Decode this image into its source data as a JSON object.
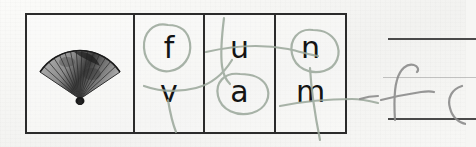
{
  "worksheet": {
    "title": "Middle sound letter choice worksheet",
    "background_color": "#f6f6f4",
    "border_color": "#2b2b2b",
    "marker_color": "#9aa79a",
    "pencil_color": "#8c8c8c",
    "letter_color": "#141414"
  },
  "table": {
    "picture_cell": {
      "icon": "folding-hand-fan-image",
      "alt": "photograph of an open folding hand fan"
    },
    "answer_word": "fan",
    "columns": [
      {
        "index": 1,
        "top_letter": "f",
        "bottom_letter": "v",
        "circled": "top",
        "circled_letter": "f"
      },
      {
        "index": 2,
        "top_letter": "u",
        "bottom_letter": "a",
        "circled": "bottom",
        "circled_letter": "a"
      },
      {
        "index": 3,
        "top_letter": "n",
        "bottom_letter": "m",
        "circled": "top",
        "circled_letter": "n"
      }
    ]
  },
  "practice": {
    "handwritten_letter": "f",
    "rule_lines": [
      "top",
      "midline",
      "baseline"
    ],
    "line_color": "#4a4a4a"
  }
}
